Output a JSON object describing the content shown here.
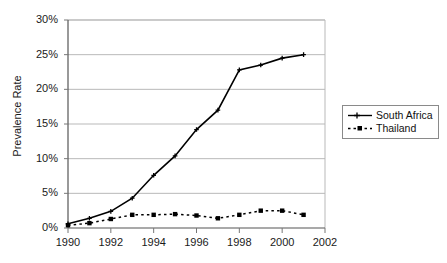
{
  "chart_data": {
    "type": "line",
    "title": "",
    "xlabel": "",
    "ylabel": "Prevalence Rate",
    "x": [
      1990,
      1991,
      1992,
      1993,
      1994,
      1995,
      1996,
      1997,
      1998,
      1999,
      2000,
      2001
    ],
    "xlim": [
      1990,
      2002
    ],
    "ylim": [
      0,
      30
    ],
    "ytick_labels": [
      "0%",
      "5%",
      "10%",
      "15%",
      "20%",
      "25%",
      "30%"
    ],
    "ytick_values": [
      0,
      5,
      10,
      15,
      20,
      25,
      30
    ],
    "xtick_labels": [
      "1990",
      "1992",
      "1994",
      "1996",
      "1998",
      "2000",
      "2002"
    ],
    "xtick_values": [
      1990,
      1992,
      1994,
      1996,
      1998,
      2000,
      2002
    ],
    "grid": "horizontal",
    "legend_position": "right",
    "series": [
      {
        "name": "South Africa",
        "marker": "cross",
        "linestyle": "solid",
        "color": "#000000",
        "values": [
          0.6,
          1.4,
          2.4,
          4.3,
          7.6,
          10.4,
          14.2,
          17.0,
          22.8,
          23.5,
          24.5,
          25.0
        ]
      },
      {
        "name": "Thailand",
        "marker": "square",
        "linestyle": "dotted",
        "color": "#000000",
        "values": [
          0.4,
          0.7,
          1.3,
          1.9,
          1.9,
          2.0,
          1.8,
          1.4,
          1.9,
          2.5,
          2.5,
          1.9
        ]
      }
    ]
  },
  "legend": {
    "items": [
      {
        "label": "South Africa"
      },
      {
        "label": "Thailand"
      }
    ]
  }
}
